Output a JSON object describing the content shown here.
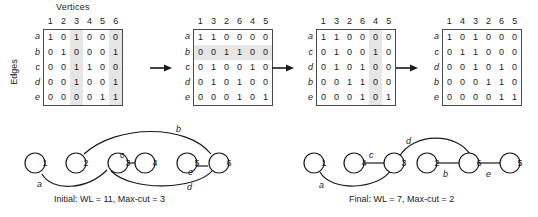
{
  "figure": {
    "vertices_label": "Vertices",
    "edges_label": "Edges"
  },
  "matrices": [
    {
      "name": "matrix-initial",
      "columns": [
        "1",
        "2",
        "3",
        "4",
        "5",
        "6"
      ],
      "rows": [
        "a",
        "b",
        "c",
        "d",
        "e"
      ],
      "values": [
        [
          1,
          0,
          1,
          0,
          0,
          0
        ],
        [
          0,
          1,
          0,
          0,
          0,
          1
        ],
        [
          0,
          0,
          1,
          1,
          0,
          0
        ],
        [
          0,
          0,
          1,
          0,
          0,
          1
        ],
        [
          0,
          0,
          0,
          0,
          1,
          1
        ]
      ],
      "shaded_columns": [
        2,
        5
      ],
      "shaded_rows": []
    },
    {
      "name": "matrix-step2",
      "columns": [
        "1",
        "3",
        "2",
        "6",
        "4",
        "5"
      ],
      "rows": [
        "a",
        "b",
        "c",
        "d",
        "e"
      ],
      "values": [
        [
          1,
          1,
          0,
          0,
          0,
          0
        ],
        [
          0,
          0,
          1,
          1,
          0,
          0
        ],
        [
          0,
          1,
          0,
          0,
          1,
          0
        ],
        [
          0,
          1,
          0,
          1,
          0,
          0
        ],
        [
          0,
          0,
          0,
          1,
          0,
          1
        ]
      ],
      "shaded_columns": [],
      "shaded_rows": [
        1
      ]
    },
    {
      "name": "matrix-step3",
      "columns": [
        "1",
        "3",
        "2",
        "6",
        "4",
        "5"
      ],
      "rows": [
        "a",
        "c",
        "d",
        "b",
        "e"
      ],
      "values": [
        [
          1,
          1,
          0,
          0,
          0,
          0
        ],
        [
          0,
          1,
          0,
          0,
          1,
          0
        ],
        [
          0,
          1,
          0,
          1,
          0,
          0
        ],
        [
          0,
          0,
          1,
          1,
          0,
          0
        ],
        [
          0,
          0,
          0,
          1,
          0,
          1
        ]
      ],
      "shaded_columns": [
        4
      ],
      "shaded_rows": []
    },
    {
      "name": "matrix-final",
      "columns": [
        "1",
        "4",
        "3",
        "2",
        "6",
        "5"
      ],
      "rows": [
        "a",
        "c",
        "d",
        "b",
        "e"
      ],
      "values": [
        [
          1,
          0,
          1,
          0,
          0,
          0
        ],
        [
          0,
          1,
          1,
          0,
          0,
          0
        ],
        [
          0,
          0,
          1,
          0,
          1,
          0
        ],
        [
          0,
          0,
          0,
          1,
          1,
          0
        ],
        [
          0,
          0,
          0,
          0,
          1,
          1
        ]
      ],
      "shaded_columns": [],
      "shaded_rows": []
    }
  ],
  "graphs": [
    {
      "name": "graph-initial",
      "caption": "Initial: WL = 11, Max-cut = 3",
      "nodes": [
        "1",
        "2",
        "3",
        "4",
        "5",
        "6"
      ],
      "edge_labels": [
        "a",
        "b",
        "c",
        "e",
        "d"
      ],
      "edges": [
        {
          "label": "a",
          "from": "1",
          "to": "3"
        },
        {
          "label": "b",
          "from": "2",
          "to": "6"
        },
        {
          "label": "c",
          "from": "3",
          "to": "4"
        },
        {
          "label": "d",
          "from": "3",
          "to": "6"
        },
        {
          "label": "e",
          "from": "5",
          "to": "6"
        }
      ]
    },
    {
      "name": "graph-final",
      "caption": "Final: WL = 7, Max-cut = 2",
      "nodes": [
        "1",
        "4",
        "3",
        "2",
        "6",
        "5"
      ],
      "edge_labels": [
        "a",
        "c",
        "d",
        "b",
        "e"
      ],
      "edges": [
        {
          "label": "a",
          "from": "1",
          "to": "3"
        },
        {
          "label": "c",
          "from": "4",
          "to": "3"
        },
        {
          "label": "d",
          "from": "3",
          "to": "6"
        },
        {
          "label": "b",
          "from": "2",
          "to": "6"
        },
        {
          "label": "e",
          "from": "6",
          "to": "5"
        }
      ]
    }
  ]
}
